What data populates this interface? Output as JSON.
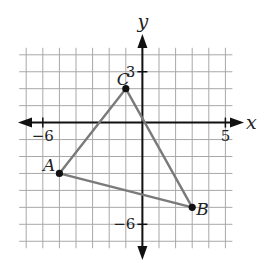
{
  "diagram": {
    "type": "coordinate-plane-triangle",
    "axes": {
      "x_label": "x",
      "y_label": "y",
      "x_ticks_labeled": [
        {
          "value": -6,
          "label": "−6"
        },
        {
          "value": 5,
          "label": "5"
        }
      ],
      "y_ticks_labeled": [
        {
          "value": 3,
          "label": "3"
        },
        {
          "value": -6,
          "label": "−6"
        }
      ],
      "grid_x_range": [
        -7,
        5
      ],
      "grid_y_range": [
        -7,
        4
      ],
      "grid_step": 1
    },
    "colors": {
      "grid": "#a8a8a8",
      "axis": "#111111",
      "triangle": "#7a7a7a",
      "vertex": "#111111"
    },
    "vertices": [
      {
        "name": "A",
        "x": -5,
        "y": -3
      },
      {
        "name": "B",
        "x": 3,
        "y": -5
      },
      {
        "name": "C",
        "x": -1,
        "y": 2
      }
    ],
    "sides": [
      [
        "A",
        "B"
      ],
      [
        "B",
        "C"
      ],
      [
        "C",
        "A"
      ]
    ]
  }
}
